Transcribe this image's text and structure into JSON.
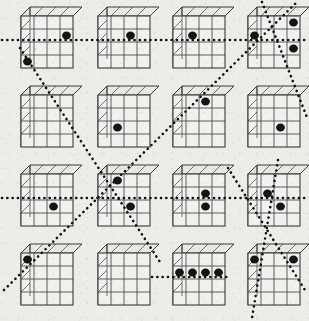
{
  "figure": {
    "title": "",
    "type": "cube-array-diagram",
    "background_color": "#eeece8",
    "ink_color": "#3b3b3b",
    "dot_color": "#151515",
    "grid": {
      "rows": 4,
      "cols": 4,
      "cell_width": 77,
      "cell_height": 79
    },
    "cube": {
      "face_rows": 4,
      "face_cols": 4,
      "face_width": 52,
      "face_height": 52,
      "depth_x": 9,
      "depth_y": 9
    }
  },
  "cubes": [
    {
      "id": "cube-r1c1",
      "row": 1,
      "col": 1,
      "label": "",
      "origin_x": 21,
      "origin_y": 16,
      "dots": [
        {
          "c": 4,
          "r": 2
        },
        {
          "c": 1,
          "r": 4
        }
      ]
    },
    {
      "id": "cube-r1c2",
      "row": 1,
      "col": 2,
      "label": "",
      "origin_x": 98,
      "origin_y": 16,
      "dots": [
        {
          "c": 3,
          "r": 2
        }
      ]
    },
    {
      "id": "cube-r1c3",
      "row": 1,
      "col": 3,
      "label": "",
      "origin_x": 173,
      "origin_y": 16,
      "dots": [
        {
          "c": 2,
          "r": 2
        }
      ]
    },
    {
      "id": "cube-r1c4",
      "row": 1,
      "col": 4,
      "label": "",
      "origin_x": 248,
      "origin_y": 16,
      "dots": [
        {
          "c": 1,
          "r": 2
        },
        {
          "c": 4,
          "r": 1
        },
        {
          "c": 4,
          "r": 3
        }
      ]
    },
    {
      "id": "cube-r2c1",
      "row": 2,
      "col": 1,
      "label": "",
      "origin_x": 21,
      "origin_y": 95,
      "dots": []
    },
    {
      "id": "cube-r2c2",
      "row": 2,
      "col": 2,
      "label": "",
      "origin_x": 98,
      "origin_y": 95,
      "dots": [
        {
          "c": 2,
          "r": 3
        }
      ]
    },
    {
      "id": "cube-r2c3",
      "row": 2,
      "col": 3,
      "label": "",
      "origin_x": 173,
      "origin_y": 95,
      "dots": [
        {
          "c": 3,
          "r": 1
        }
      ]
    },
    {
      "id": "cube-r2c4",
      "row": 2,
      "col": 4,
      "label": "",
      "origin_x": 248,
      "origin_y": 95,
      "dots": [
        {
          "c": 3,
          "r": 3
        }
      ]
    },
    {
      "id": "cube-r3c1",
      "row": 3,
      "col": 1,
      "label": "",
      "origin_x": 21,
      "origin_y": 174,
      "dots": [
        {
          "c": 3,
          "r": 3
        }
      ]
    },
    {
      "id": "cube-r3c2",
      "row": 3,
      "col": 2,
      "label": "",
      "origin_x": 98,
      "origin_y": 174,
      "dots": [
        {
          "c": 2,
          "r": 1
        },
        {
          "c": 3,
          "r": 3
        }
      ]
    },
    {
      "id": "cube-r3c3",
      "row": 3,
      "col": 3,
      "label": "",
      "origin_x": 173,
      "origin_y": 174,
      "dots": [
        {
          "c": 3,
          "r": 2
        },
        {
          "c": 3,
          "r": 3
        }
      ]
    },
    {
      "id": "cube-r3c4",
      "row": 3,
      "col": 4,
      "label": "",
      "origin_x": 248,
      "origin_y": 174,
      "dots": [
        {
          "c": 2,
          "r": 2
        },
        {
          "c": 3,
          "r": 3
        }
      ]
    },
    {
      "id": "cube-r4c1",
      "row": 4,
      "col": 1,
      "label": "",
      "origin_x": 21,
      "origin_y": 253,
      "dots": [
        {
          "c": 1,
          "r": 1
        }
      ]
    },
    {
      "id": "cube-r4c2",
      "row": 4,
      "col": 2,
      "label": "",
      "origin_x": 98,
      "origin_y": 253,
      "dots": []
    },
    {
      "id": "cube-r4c3",
      "row": 4,
      "col": 3,
      "label": "",
      "origin_x": 173,
      "origin_y": 253,
      "dots": [
        {
          "c": 1,
          "r": 2
        },
        {
          "c": 2,
          "r": 2
        },
        {
          "c": 3,
          "r": 2
        },
        {
          "c": 4,
          "r": 2
        }
      ]
    },
    {
      "id": "cube-r4c4",
      "row": 4,
      "col": 4,
      "label": "",
      "origin_x": 248,
      "origin_y": 253,
      "dots": [
        {
          "c": 1,
          "r": 1
        },
        {
          "c": 4,
          "r": 1
        }
      ]
    }
  ],
  "paths": [
    {
      "id": "path-horizontal-row1",
      "kind": "horizontal",
      "points": "2,40 307,40"
    },
    {
      "id": "path-horizontal-row3",
      "kind": "horizontal",
      "points": "2,198 307,198"
    },
    {
      "id": "path-horizontal-row4-short",
      "kind": "horizontal",
      "points": "152,277 228,277"
    },
    {
      "id": "path-diagonal-main",
      "kind": "diagonal",
      "points": "20,48 160,262"
    },
    {
      "id": "path-diagonal-upright",
      "kind": "diagonal",
      "points": "4,290 296,3"
    },
    {
      "id": "path-diagonal-right-descend",
      "kind": "diagonal",
      "points": "262,2 308,120"
    },
    {
      "id": "path-diagonal-lower-right",
      "kind": "diagonal",
      "points": "228,168 305,290"
    },
    {
      "id": "path-vertical-right",
      "kind": "vertical",
      "points": "278,160 252,318"
    }
  ],
  "legend": {
    "dot_meaning": "marked cell",
    "line_meaning": "traversal path"
  }
}
